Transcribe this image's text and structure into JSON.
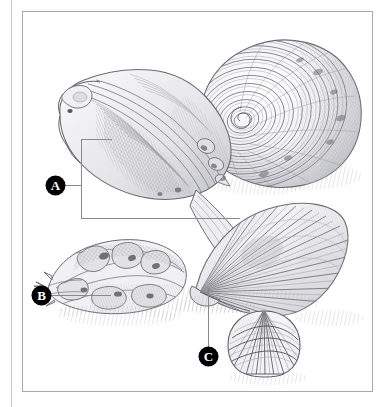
{
  "plate": {
    "background_color": "#ffffff",
    "frame_color": "#a9a9ad",
    "medium": "pencil and ink line illustration",
    "subject": "still life group of marine mollusc shells"
  },
  "callouts": [
    {
      "id": "A",
      "label": "A",
      "leader_style": "bracket",
      "points_to": "large-whelk-aperture",
      "label_color": "#ffffff",
      "marker_color": "#000000"
    },
    {
      "id": "B",
      "label": "B",
      "leader_style": "horizontal-line",
      "points_to": "spiny-murex-shell",
      "label_color": "#ffffff",
      "marker_color": "#000000"
    },
    {
      "id": "C",
      "label": "C",
      "leader_style": "vertical-line",
      "points_to": "scallop-shell-hinge",
      "label_color": "#ffffff",
      "marker_color": "#000000"
    }
  ],
  "specimens": [
    {
      "name": "tun-snail",
      "description": "large spiral-ribbed tun shell, upper right"
    },
    {
      "name": "whelk-aperture",
      "description": "large whelk shown aperture-side, upper left"
    },
    {
      "name": "murex-shell",
      "description": "spiny murex / rock shell, lower left"
    },
    {
      "name": "scallop-shell",
      "description": "ribbed fan scallop, lower right"
    },
    {
      "name": "cockle-shell",
      "description": "small domed latticed cockle, bottom centre-right"
    }
  ],
  "palette": {
    "ink": "#3b3b40",
    "mid_tone": "#8e8e94",
    "light_tone": "#c9c9ce",
    "shadow": "#b4b4ba",
    "paper": "#ffffff"
  }
}
